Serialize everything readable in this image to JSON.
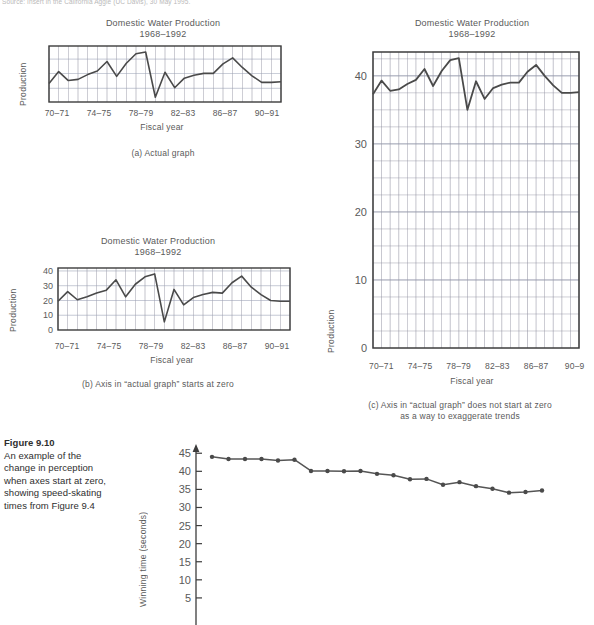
{
  "source_note": "Source: Insert in the California Aggie (UC Davis), 30 May 1995.",
  "figure": {
    "number_label": "Figure 9.10",
    "caption_lines": [
      "An example of the",
      "change in perception",
      "when axes start at zero,",
      "showing speed-skating",
      "times from Figure 9.4"
    ]
  },
  "common": {
    "title_line1": "Domestic Water Production",
    "title_line2": "1968–1992",
    "xlabel": "Fiscal year",
    "ylabel": "Production",
    "xticks": [
      "70–71",
      "74–75",
      "78–79",
      "82–83",
      "86–87",
      "90–91"
    ],
    "xticks_clipped": [
      "70–71",
      "74–75",
      "78–79",
      "82–83",
      "86–87",
      "90–9"
    ]
  },
  "captions": {
    "a": "(a) Actual graph",
    "b": "(b) Axis in “actual graph” starts at zero",
    "c_line1": "(c) Axis in “actual graph” does not start at zero",
    "c_line2": "as a way to exaggerate trends"
  },
  "colors": {
    "line": "#4a4a4a",
    "grid_minor": "#8c8c9c",
    "grid_major": "#9aa0b4",
    "frame": "#3c3c3c",
    "text": "#5a5a5a",
    "caption_text": "#2e2e2e"
  },
  "chart_data": [
    {
      "id": "a",
      "type": "line",
      "title": "Domestic Water Production 1968–1992",
      "xlabel": "Fiscal year",
      "ylabel": "Production",
      "grid": true,
      "ylim": [
        34.2,
        43.6
      ],
      "yticks": [],
      "xtick_labels": [
        "70–71",
        "74–75",
        "78–79",
        "82–83",
        "86–87",
        "90–91"
      ],
      "x": [
        1968,
        1969,
        1970,
        1971,
        1972,
        1973,
        1974,
        1975,
        1976,
        1977,
        1978,
        1979,
        1980,
        1981,
        1982,
        1983,
        1984,
        1985,
        1986,
        1987,
        1988,
        1989,
        1990,
        1991,
        1992
      ],
      "values": [
        37.3,
        39.3,
        37.8,
        38.0,
        38.8,
        39.4,
        41.0,
        38.5,
        40.7,
        42.3,
        42.6,
        35.0,
        39.2,
        36.6,
        38.2,
        38.7,
        39.0,
        39.0,
        40.6,
        41.6,
        40.0,
        38.6,
        37.5,
        37.5,
        37.6
      ]
    },
    {
      "id": "b",
      "type": "line",
      "title": "Domestic Water Production 1968–1992",
      "xlabel": "Fiscal year",
      "ylabel": "Production",
      "grid": true,
      "ylim": [
        0,
        42
      ],
      "yticks": [
        0,
        10,
        20,
        30,
        40
      ],
      "xtick_labels": [
        "70–71",
        "74–75",
        "78–79",
        "82–83",
        "86–87",
        "90–91"
      ],
      "x": [
        1968,
        1969,
        1970,
        1971,
        1972,
        1973,
        1974,
        1975,
        1976,
        1977,
        1978,
        1979,
        1980,
        1981,
        1982,
        1983,
        1984,
        1985,
        1986,
        1987,
        1988,
        1989,
        1990,
        1991,
        1992
      ],
      "values": [
        19.5,
        26.0,
        20.5,
        22.5,
        25.0,
        27.0,
        34.0,
        22.5,
        31.0,
        36.0,
        38.0,
        5.5,
        27.5,
        17.0,
        22.0,
        24.0,
        25.5,
        25.0,
        32.0,
        36.5,
        29.0,
        24.0,
        20.0,
        19.5,
        19.5
      ]
    },
    {
      "id": "c",
      "type": "line",
      "title": "Domestic Water Production 1968–1992",
      "xlabel": "Fiscal year",
      "ylabel": "Production",
      "grid": true,
      "ylim": [
        0,
        43.5
      ],
      "yticks": [
        0,
        10,
        20,
        30,
        40
      ],
      "xtick_labels": [
        "70–71",
        "74–75",
        "78–79",
        "82–83",
        "86–87",
        "90–9"
      ],
      "x": [
        1968,
        1969,
        1970,
        1971,
        1972,
        1973,
        1974,
        1975,
        1976,
        1977,
        1978,
        1979,
        1980,
        1981,
        1982,
        1983,
        1984,
        1985,
        1986,
        1987,
        1988,
        1989,
        1990,
        1991,
        1992
      ],
      "values": [
        37.3,
        39.3,
        37.8,
        38.0,
        38.8,
        39.4,
        41.0,
        38.5,
        40.7,
        42.3,
        42.6,
        35.0,
        39.2,
        36.6,
        38.2,
        38.7,
        39.0,
        39.0,
        40.6,
        41.6,
        40.0,
        38.6,
        37.5,
        37.5,
        37.6
      ]
    },
    {
      "id": "skating",
      "type": "line",
      "title": "",
      "xlabel": "",
      "ylabel": "Winning time (seconds)",
      "grid": false,
      "ylim": [
        0,
        47
      ],
      "yticks": [
        5,
        10,
        15,
        20,
        25,
        30,
        35,
        40,
        45
      ],
      "markers": true,
      "values": [
        44.0,
        43.4,
        43.4,
        43.4,
        43.0,
        43.2,
        40.1,
        40.1,
        40.0,
        40.1,
        39.3,
        38.9,
        37.8,
        37.9,
        36.3,
        37.0,
        35.9,
        35.2,
        34.1,
        34.3,
        34.7
      ]
    }
  ]
}
